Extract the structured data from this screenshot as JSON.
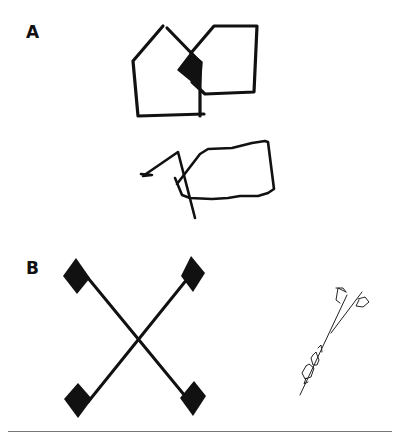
{
  "figure": {
    "panels": [
      {
        "label": "A",
        "description": "Model: two overlapping pentagons (upper) and patient copy (lower)",
        "items": [
          "interlocking-pentagons-model",
          "pentagon-copy-drawing"
        ]
      },
      {
        "label": "B",
        "description": "Model: X-shaped cross with diamond tips (left) and patient copy (right)",
        "items": [
          "diamond-cross-model",
          "diamond-cross-copy-drawing"
        ]
      }
    ],
    "colors": {
      "ink": "#111111",
      "rule": "#777777",
      "background": "#ffffff"
    }
  }
}
